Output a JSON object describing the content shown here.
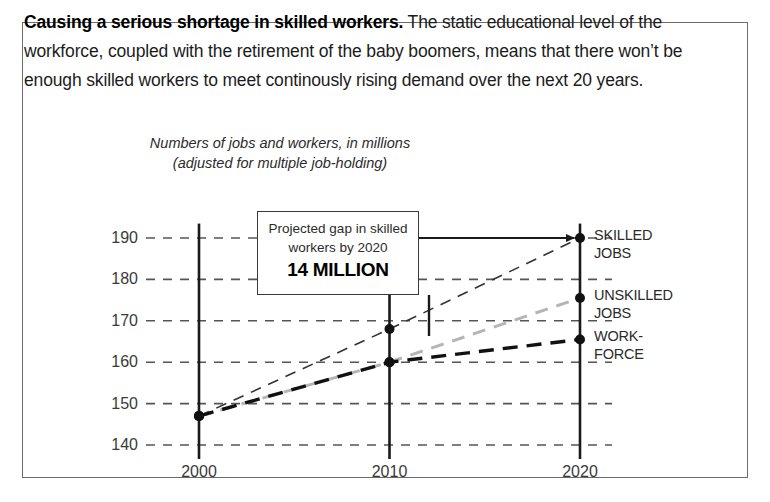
{
  "blurb": {
    "lead": "Causing a serious shortage in skilled workers.",
    "body": " The static educational level of the workforce, coupled with the retirement of the baby boomers, means that there won’t be enough skilled workers to meet continously rising demand over the next 20 years."
  },
  "callout": {
    "line1": "Projected gap in skilled",
    "line2": "workers by 2020",
    "value": "14 MILLION"
  },
  "chart_data": {
    "type": "line",
    "title": "Numbers of jobs and workers, in millions",
    "subtitle": "(adjusted for multiple job-holding)",
    "xlabel": "",
    "ylabel": "",
    "x": [
      2000,
      2010,
      2020
    ],
    "xticklabels": [
      "2000",
      "2010",
      "2020"
    ],
    "yticks": [
      140,
      150,
      160,
      170,
      180,
      190
    ],
    "yticklabels": [
      "140",
      "150",
      "160",
      "170",
      "180",
      "190"
    ],
    "ylim": [
      138,
      193
    ],
    "xlim": [
      1997,
      2021
    ],
    "grid": "horizontal-dashed",
    "legend": "right-of-axes",
    "series": [
      {
        "name": "SKILLED\nJOBS",
        "label_line1": "SKILLED",
        "label_line2": "JOBS",
        "values": [
          147,
          168,
          190
        ],
        "style": "dashed",
        "color": "#333333",
        "width": 1.6
      },
      {
        "name": "UNSKILLED\nJOBS",
        "label_line1": "UNSKILLED",
        "label_line2": "JOBS",
        "values": [
          147,
          160,
          175.5
        ],
        "style": "dashed",
        "color": "#b5b5b5",
        "width": 3.0
      },
      {
        "name": "WORK-\nFORCE",
        "label_line1": "WORK-",
        "label_line2": "FORCE",
        "values": [
          147,
          160,
          165.5
        ],
        "style": "dashed",
        "color": "#111111",
        "width": 3.4
      }
    ],
    "annotations": [
      {
        "name": "gap-arrow",
        "text": "",
        "from": [
          2010.0,
          190
        ],
        "to": [
          2020,
          190
        ],
        "style": "solid-arrow"
      }
    ]
  }
}
